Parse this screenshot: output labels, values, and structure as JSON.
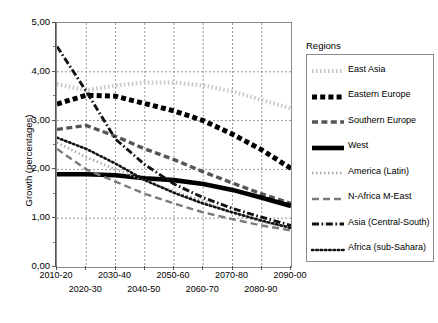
{
  "axes": {
    "ylabel": "Growth (percentages)",
    "yticks": [
      "5,00",
      "4,00",
      "3,00",
      "2,00",
      "1,00",
      "0,00"
    ],
    "xticks_top": [
      "2010-20",
      "2030-40",
      "2050-60",
      "2070-80",
      "2090-00"
    ],
    "xticks_bottom": [
      "2020-30",
      "2040-50",
      "2060-70",
      "2080-90"
    ]
  },
  "legend": {
    "title": "Regions",
    "items": [
      {
        "label": "East Asia",
        "key": "dotted-lightgray",
        "color": "#c9c9c9"
      },
      {
        "label": "Eastern Europe",
        "key": "square-dash-black",
        "color": "#000000"
      },
      {
        "label": "Southern Europe",
        "key": "dash-darkgray",
        "color": "#555555"
      },
      {
        "label": "West",
        "key": "solid-thick-black",
        "color": "#000000"
      },
      {
        "label": "America (Latin)",
        "key": "fine-dot-gray",
        "color": "#a8a8a8"
      },
      {
        "label": "N-Africa M-East",
        "key": "long-dash-gray",
        "color": "#7a7a7a"
      },
      {
        "label": "Asia (Central-South)",
        "key": "dash-dot-black",
        "color": "#111111"
      },
      {
        "label": "Africa (sub-Sahara)",
        "key": "dot-black",
        "color": "#111111"
      }
    ]
  },
  "chart_data": {
    "type": "line",
    "title": "",
    "xlabel": "",
    "ylabel": "Growth (percentages)",
    "ylim": [
      0,
      5
    ],
    "ytick_step": 1,
    "yminor_step": 0.5,
    "grid": true,
    "legend_position": "right",
    "categories": [
      "2010-20",
      "2020-30",
      "2030-40",
      "2040-50",
      "2050-60",
      "2060-70",
      "2070-80",
      "2080-90",
      "2090-00"
    ],
    "series": [
      {
        "name": "East Asia",
        "color": "#c9c9c9",
        "style": "dotted",
        "values": [
          3.75,
          3.62,
          3.72,
          3.78,
          3.78,
          3.72,
          3.6,
          3.42,
          3.25
        ]
      },
      {
        "name": "Eastern Europe",
        "color": "#000000",
        "style": "square-dash",
        "values": [
          3.34,
          3.52,
          3.5,
          3.35,
          3.2,
          3.0,
          2.72,
          2.4,
          2.02
        ]
      },
      {
        "name": "Southern Europe",
        "color": "#555555",
        "style": "dash",
        "values": [
          2.82,
          2.9,
          2.68,
          2.42,
          2.2,
          1.95,
          1.72,
          1.5,
          1.3
        ]
      },
      {
        "name": "West",
        "color": "#000000",
        "style": "solid-thick",
        "values": [
          1.9,
          1.9,
          1.88,
          1.82,
          1.78,
          1.7,
          1.58,
          1.42,
          1.25
        ]
      },
      {
        "name": "America (Latin)",
        "color": "#a8a8a8",
        "style": "fine-dot",
        "values": [
          2.55,
          2.25,
          2.0,
          1.78,
          1.55,
          1.35,
          1.1,
          0.92,
          0.8
        ]
      },
      {
        "name": "N-Africa M-East",
        "color": "#7a7a7a",
        "style": "long-dash",
        "values": [
          2.42,
          2.0,
          1.75,
          1.5,
          1.3,
          1.12,
          0.98,
          0.85,
          0.75
        ]
      },
      {
        "name": "Asia (Central-South)",
        "color": "#111111",
        "style": "dash-dot",
        "values": [
          4.52,
          3.6,
          2.62,
          2.1,
          1.7,
          1.42,
          1.2,
          1.02,
          0.85
        ]
      },
      {
        "name": "Africa (sub-Sahara)",
        "color": "#111111",
        "style": "dot",
        "values": [
          2.65,
          2.42,
          2.12,
          1.78,
          1.52,
          1.3,
          1.12,
          0.95,
          0.8
        ]
      }
    ]
  }
}
